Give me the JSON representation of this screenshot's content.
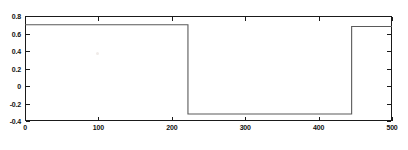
{
  "chart_data": {
    "type": "line",
    "title": "",
    "subtitle": "",
    "xlabel": "",
    "ylabel": "",
    "xlim": [
      0,
      500
    ],
    "ylim": [
      -0.4,
      0.8
    ],
    "xticks": [
      0,
      100,
      200,
      300,
      400,
      500
    ],
    "yticks": [
      0.8,
      0.6,
      0.4,
      0.2,
      0,
      -0.2,
      -0.4
    ],
    "xticklabels": [
      "0",
      "100",
      "200",
      "300",
      "400",
      "500"
    ],
    "yticklabels": [
      "0.8",
      "0.6",
      "0.4",
      "0.2",
      "0",
      "-0.2",
      "-0.4"
    ],
    "grid": false,
    "legend": null,
    "legend_position": "none",
    "line_color": "#5a5a5a",
    "frame_color": "#1a1a1a",
    "background": "#ffffff",
    "series": [
      {
        "name": "signal",
        "x": [
          0,
          222,
          222,
          445,
          445,
          500
        ],
        "values": [
          0.7,
          0.7,
          -0.32,
          -0.32,
          0.68,
          0.68
        ]
      }
    ],
    "levels": {
      "high": 0.7,
      "low": -0.32
    },
    "transitions": [
      {
        "x": 222,
        "from": 0.7,
        "to": -0.32,
        "direction": "falling"
      },
      {
        "x": 445,
        "from": -0.32,
        "to": 0.68,
        "direction": "rising"
      }
    ]
  }
}
